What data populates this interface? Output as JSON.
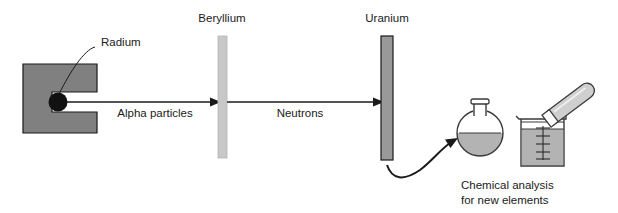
{
  "diagram": {
    "background_color": "#ffffff",
    "labels": {
      "radium": "Radium",
      "beryllium": "Beryllium",
      "uranium": "Uranium",
      "alpha_particles": "Alpha particles",
      "neutrons": "Neutrons"
    },
    "caption": {
      "line1": "Chemical analysis",
      "line2": "for new elements"
    },
    "colors": {
      "lead_block": "#808080",
      "lead_block_outline": "#1a1a1a",
      "radium_source": "#111111",
      "beryllium_bar": "#c8c8c8",
      "beryllium_outline": "#b0b0b0",
      "uranium_bar": "#999999",
      "uranium_outline": "#1a1a1a",
      "glassware_outline": "#3a3a3a",
      "liquid": "#b3b3b3",
      "arrow": "#1a1a1a",
      "text": "#1a1a1a"
    },
    "elements": {
      "lead_block_name": "lead shield block",
      "radium_source_name": "radium source",
      "beryllium_target_name": "beryllium target plate",
      "uranium_target_name": "uranium target plate",
      "flask_name": "round bottom flask",
      "beaker_name": "graduated beaker",
      "test_tube_name": "test tube",
      "beaker_graduations": 5
    }
  }
}
